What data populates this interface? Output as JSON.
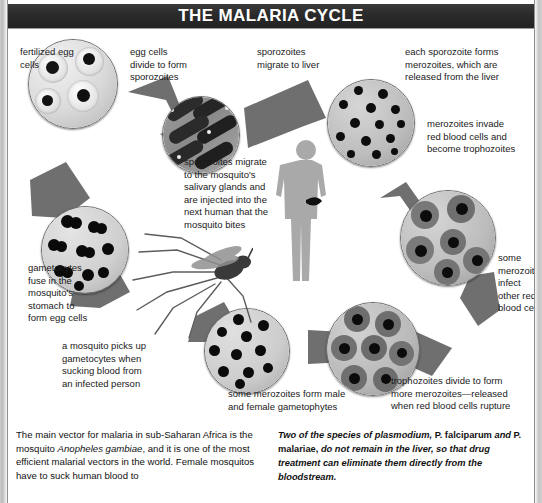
{
  "title": "THE MALARIA CYCLE",
  "diagram": {
    "labels": [
      {
        "key": "fertilized_egg_cells",
        "text": "fertilized egg\ncells"
      },
      {
        "key": "egg_cells_divide",
        "text": "egg cells\ndivide to form\nsporozoites"
      },
      {
        "key": "sporozoites_migrate_liver",
        "text": "sporozoites\nmigrate to liver"
      },
      {
        "key": "each_sporozoite_forms",
        "text": "each sporozoite forms\nmerozoites, which are\nreleased from the liver"
      },
      {
        "key": "merozoites_invade",
        "text": "merozoites invade\nred blood cells and\nbecome trophozoites"
      },
      {
        "key": "sporozoites_migrate_salivary",
        "text": "sporozoites migrate\nto the mosquito's\nsalivary glands and\nare injected into the\nnext human that the\nmosquito bites"
      },
      {
        "key": "gametocytes_fuse",
        "text": "gametocytes\nfuse in the\nmosquito's\nstomach to\nform egg cells"
      },
      {
        "key": "mosquito_picks_up",
        "text": "a mosquito picks up\ngametocytes when\nsucking blood from\nan infected person"
      },
      {
        "key": "some_merozoites_infect",
        "text": "some\nmerozoites\ninfect\nother red\nblood cells"
      },
      {
        "key": "some_merozoites_form_male",
        "text": "some merozoites form male\nand female gametophytes"
      },
      {
        "key": "trophozoites_divide",
        "text": "trophozoites divide to form\nmore merozoites—released\nwhen red blood cells rupture"
      }
    ],
    "figure_names": {
      "human": "human-silhouette",
      "mosquito": "mosquito-illustration"
    },
    "micrographs": [
      {
        "key": "fertilized-egg-cells-micrograph",
        "caption": "fertilized egg cells"
      },
      {
        "key": "sporozoites-micrograph",
        "caption": "egg cells divide to form sporozoites"
      },
      {
        "key": "liver-merozoites-micrograph",
        "caption": "each sporozoite forms merozoites"
      },
      {
        "key": "trophozoites-micrograph",
        "caption": "merozoites invade red blood cells"
      },
      {
        "key": "infected-red-cells-micrograph",
        "caption": "trophozoites divide to form more merozoites"
      },
      {
        "key": "gametophytes-micrograph",
        "caption": "some merozoites form male and female gametophytes"
      },
      {
        "key": "gametocytes-micrograph",
        "caption": "a mosquito picks up gametocytes"
      }
    ],
    "colors": {
      "arrow": "#6f6f6f",
      "title_bar": "#2b2b2b",
      "text": "#1a1a1a"
    }
  },
  "footer": {
    "left_text_parts": [
      {
        "t": "The main vector for malaria in sub-Saharan Africa is the mosquito ",
        "style": "normal"
      },
      {
        "t": "Anopheles gambiae",
        "style": "italic"
      },
      {
        "t": ", and it is one of the most efficient malarial vectors in the world. Female mosquitos have to suck human blood to",
        "style": "normal"
      }
    ],
    "left_text": "The main vector for malaria in sub-Saharan Africa is the mosquito Anopheles gambiae, and it is one of the most efficient malarial vectors in the world. Female mosquitos have to suck human blood to",
    "right_text_parts": [
      {
        "t": "Two of the species of plasmodium,",
        "style": "italic"
      },
      {
        "t": " P. falciparum ",
        "style": "upright"
      },
      {
        "t": "and",
        "style": "italic"
      },
      {
        "t": " P. malariae,",
        "style": "upright"
      },
      {
        "t": " do not remain in the liver, so that drug treatment can eliminate them directly from the bloodstream.",
        "style": "italic"
      }
    ],
    "right_text": "Two of the species of plasmodium, P. falciparum and P. malariae, do not remain in the liver, so that drug treatment can eliminate them directly from the bloodstream."
  }
}
